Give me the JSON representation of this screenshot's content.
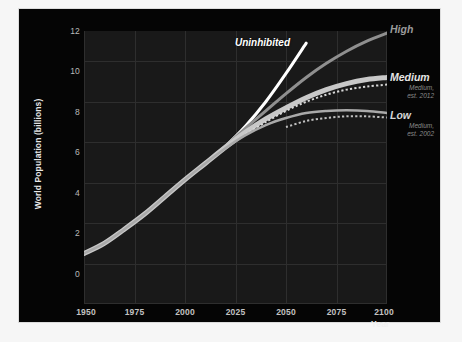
{
  "figure": {
    "background_color": "#050505",
    "plot_background_color": "#191919",
    "outer_background_color": "#f6f6f6"
  },
  "axes": {
    "y_title": "World Population (billions)",
    "x_title": "Year",
    "y_ticks": [
      "0",
      "2",
      "4",
      "6",
      "8",
      "10",
      "12"
    ],
    "x_ticks": [
      "1950",
      "1975",
      "2000",
      "2025",
      "2050",
      "2075",
      "2100"
    ]
  },
  "annotations": {
    "uninhibited": "Uninhibited"
  },
  "legend": {
    "high": "High",
    "medium": "Medium",
    "medium_sub_line1": "Medium,",
    "medium_sub_line2": "est. 2012",
    "low": "Low",
    "low_sub_line1": "Medium,",
    "low_sub_line2": "est. 2002"
  },
  "chart_data": {
    "type": "line",
    "title": "",
    "xlabel": "Year",
    "ylabel": "World Population (billions)",
    "xlim": [
      1950,
      2100
    ],
    "ylim": [
      0,
      13.5
    ],
    "grid": true,
    "legend_position": "right",
    "x": [
      1950,
      1960,
      1970,
      1980,
      1990,
      2000,
      2010,
      2020,
      2030,
      2040,
      2050,
      2060,
      2070,
      2080,
      2090,
      2100
    ],
    "series": [
      {
        "name": "Uninhibited",
        "color": "#ffffff",
        "style": "solid",
        "width": 3,
        "values": [
          2.5,
          3.0,
          3.7,
          4.45,
          5.3,
          6.15,
          6.95,
          7.8,
          8.8,
          10.0,
          11.4,
          12.9,
          null,
          null,
          null,
          null
        ]
      },
      {
        "name": "High",
        "color": "#8f8f8f",
        "style": "solid",
        "width": 3,
        "values": [
          2.5,
          3.0,
          3.7,
          4.45,
          5.3,
          6.15,
          6.95,
          7.8,
          8.7,
          9.55,
          10.4,
          11.2,
          11.9,
          12.5,
          13.0,
          13.4
        ]
      },
      {
        "name": "Medium",
        "color": "#c8c8c8",
        "style": "solid",
        "width": 5,
        "values": [
          2.5,
          3.0,
          3.7,
          4.45,
          5.3,
          6.15,
          6.95,
          7.75,
          8.5,
          9.15,
          9.7,
          10.2,
          10.6,
          10.9,
          11.1,
          11.2
        ]
      },
      {
        "name": "Medium, est. 2012",
        "color": "#d8d8d8",
        "style": "dotted",
        "width": 2,
        "values": [
          null,
          null,
          null,
          null,
          null,
          null,
          null,
          null,
          8.4,
          9.0,
          9.55,
          10.0,
          10.35,
          10.6,
          10.75,
          10.85
        ]
      },
      {
        "name": "Low",
        "color": "#a9a9a9",
        "style": "solid",
        "width": 2.5,
        "values": [
          2.5,
          3.0,
          3.7,
          4.45,
          5.3,
          6.15,
          6.95,
          7.7,
          8.35,
          8.85,
          9.2,
          9.45,
          9.55,
          9.58,
          9.55,
          9.45
        ]
      },
      {
        "name": "Medium, est. 2002",
        "color": "#c0c0c0",
        "style": "dotted",
        "width": 2,
        "values": [
          null,
          null,
          null,
          null,
          null,
          null,
          null,
          null,
          null,
          null,
          8.75,
          9.05,
          9.2,
          9.28,
          9.28,
          9.22
        ]
      }
    ]
  }
}
